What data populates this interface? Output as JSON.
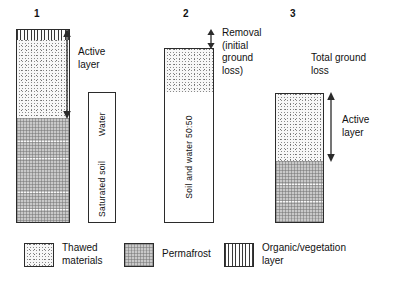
{
  "figure": {
    "columns": [
      {
        "number": "1",
        "annotation": "Active\nlayer",
        "layers": [
          {
            "name": "organic-vegetation-layer",
            "fill": "organic",
            "label": ""
          },
          {
            "name": "thawed-materials",
            "fill": "thawed",
            "label": ""
          },
          {
            "name": "permafrost",
            "fill": "permafrost",
            "label": ""
          }
        ]
      },
      {
        "number": "2",
        "annotation": "Removal\n(initial\nground\nloss)",
        "layers": [
          {
            "name": "thawed-materials",
            "fill": "thawed",
            "label": ""
          },
          {
            "name": "soil-and-water",
            "fill": "white",
            "label": "Soil and water 50:50"
          }
        ]
      },
      {
        "number": "3",
        "annotation": "Total ground\nloss",
        "annotation_secondary": "Active\nlayer",
        "layers": [
          {
            "name": "thawed-materials",
            "fill": "thawed",
            "label": ""
          },
          {
            "name": "permafrost",
            "fill": "permafrost",
            "label": ""
          }
        ]
      }
    ],
    "water_column": {
      "upper_label": "Water",
      "lower_label": "Saturated soil"
    },
    "legend": [
      {
        "icon": "stipple-swatch-icon",
        "label": "Thawed\nmaterials",
        "fill": "thawed"
      },
      {
        "icon": "gray-grid-swatch-icon",
        "label": "Permafrost",
        "fill": "permafrost"
      },
      {
        "icon": "vertical-stripe-swatch-icon",
        "label": "Organic/vegetation\nlayer",
        "fill": "organic"
      }
    ],
    "colors": {
      "outline": "#2b2b2b",
      "permafrost_gray": "#c9c9c9",
      "thawed_stipple": "#5a5a5a",
      "text": "#111111",
      "background": "#ffffff"
    }
  }
}
